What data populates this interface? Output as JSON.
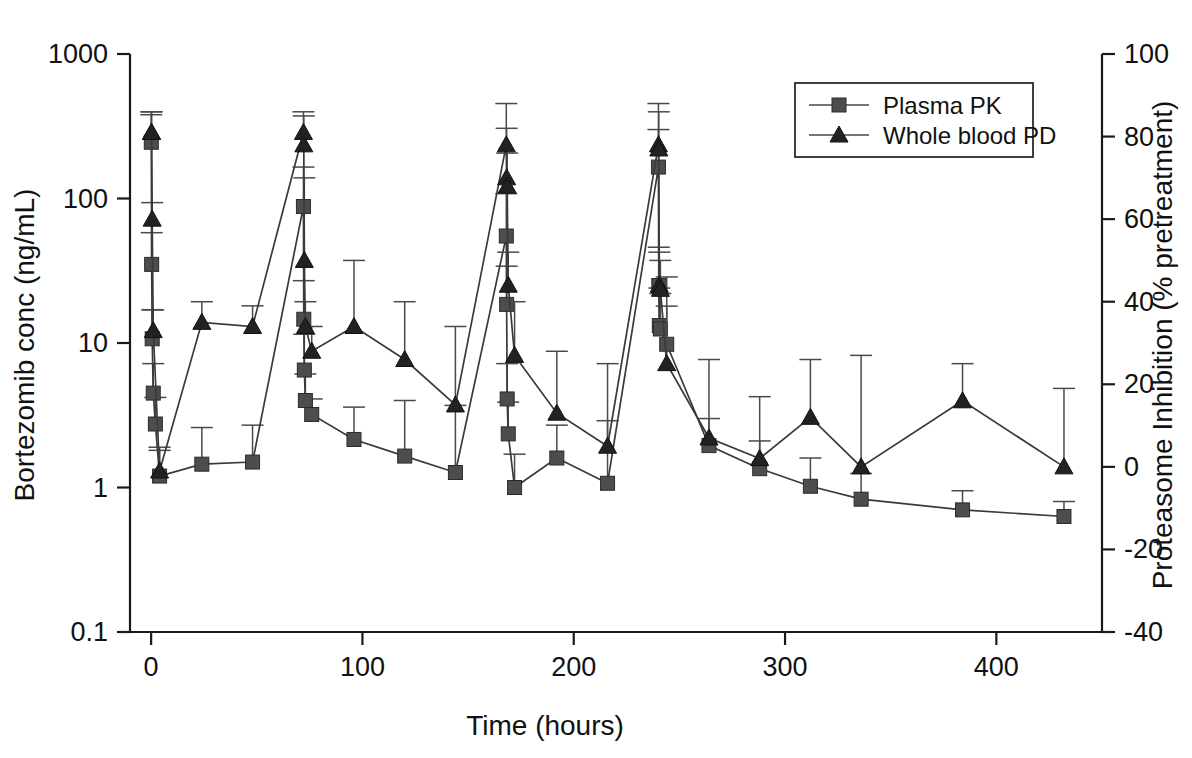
{
  "chart_data": {
    "type": "line",
    "title": "",
    "xlabel": "Time (hours)",
    "ylabel": "Bortezomib conc (ng/mL)",
    "y2label": "Proteasome Inhibition (% pretreatment)",
    "xlim": [
      -10,
      450
    ],
    "xticks": [
      0,
      100,
      200,
      300,
      400
    ],
    "xticklabels": [
      "0",
      "100",
      "200",
      "300",
      "400"
    ],
    "yscale": "log",
    "ylim": [
      0.1,
      1000
    ],
    "yticks": [
      0.1,
      1,
      10,
      100,
      1000
    ],
    "yticklabels": [
      "0.1",
      "1",
      "10",
      "100",
      "1000"
    ],
    "y2lim": [
      -40,
      100
    ],
    "y2ticks": [
      -40,
      -20,
      0,
      20,
      40,
      60,
      80,
      100
    ],
    "y2ticklabels": [
      "-40",
      "-20",
      "0",
      "20",
      "40",
      "60",
      "80",
      "100"
    ],
    "grid": false,
    "legend_position": "top-right",
    "series": [
      {
        "name": "Plasma PK",
        "marker": "square",
        "axis": "left",
        "units": "ng/mL",
        "x": [
          0.08,
          0.25,
          0.5,
          1,
          2,
          4,
          24,
          48,
          72.08,
          72.25,
          72.5,
          73,
          76,
          96,
          120,
          144,
          168.08,
          168.25,
          168.5,
          169,
          172,
          192,
          216,
          240.08,
          240.25,
          240.5,
          241,
          244,
          264,
          288,
          312,
          336,
          384,
          432
        ],
        "values": [
          245,
          35,
          10.7,
          4.5,
          2.75,
          1.2,
          1.45,
          1.5,
          88,
          14.6,
          6.5,
          4.0,
          3.2,
          2.15,
          1.65,
          1.27,
          55,
          18.5,
          4.1,
          2.35,
          1.0,
          1.6,
          1.07,
          165,
          25,
          13.2,
          12.5,
          9.8,
          1.95,
          1.35,
          1.02,
          0.83,
          0.7,
          0.63
        ],
        "err_upper": [
          380,
          58,
          17,
          7.2,
          4.2,
          1.9,
          2.6,
          2.7,
          165,
          27,
          11.5,
          6.1,
          4.1,
          3.6,
          4.0,
          3.7,
          108,
          34,
          7.2,
          3.9,
          1.7,
          2.7,
          2.9,
          300,
          46,
          24,
          22,
          18,
          3.0,
          2.1,
          1.6,
          1.25,
          0.95,
          0.8
        ]
      },
      {
        "name": "Whole blood PD",
        "marker": "triangle",
        "axis": "right",
        "units": "% pretreatment",
        "x": [
          0.08,
          0.25,
          0.5,
          1,
          4,
          24,
          48,
          72.08,
          72.25,
          72.5,
          73,
          76,
          96,
          120,
          144,
          168.08,
          168.25,
          168.5,
          169,
          172,
          192,
          216,
          240.08,
          240.25,
          240.5,
          241,
          244,
          264,
          288,
          312,
          336,
          384,
          432
        ],
        "values_pct": [
          81,
          81,
          60,
          33,
          -1,
          35,
          34,
          81,
          78,
          50,
          34,
          28,
          34,
          26,
          15,
          78,
          70,
          68,
          44,
          27,
          13,
          5,
          78,
          77,
          44,
          43,
          25,
          7,
          2,
          12,
          0,
          16,
          0
        ],
        "values_right_axis": [
          81,
          81,
          60,
          33,
          -1,
          35,
          34,
          81,
          78,
          50,
          34,
          28,
          34,
          26,
          15,
          78,
          70,
          68,
          44,
          27,
          13,
          5,
          78,
          77,
          44,
          43,
          25,
          7,
          2,
          12,
          0,
          16,
          0
        ],
        "err_upper_pct": [
          86,
          86,
          64,
          38,
          4,
          40,
          39,
          86,
          85,
          70,
          40,
          34,
          50,
          40,
          34,
          88,
          82,
          76,
          52,
          40,
          28,
          25,
          88,
          86,
          52,
          50,
          46,
          26,
          17,
          26,
          27,
          25,
          19
        ]
      }
    ]
  },
  "axes": {
    "left_title": "Bortezomib conc (ng/mL)",
    "right_title": "Proteasome Inhibition (% pretreatment)",
    "bottom_title": "Time (hours)"
  },
  "legend": {
    "items": [
      {
        "label": "Plasma PK",
        "marker": "square"
      },
      {
        "label": "Whole blood PD",
        "marker": "triangle"
      }
    ]
  },
  "colors": {
    "axis": "#1a1a1a",
    "series_pk": "#4d4d4d",
    "series_pd": "#222222",
    "background": "#ffffff"
  }
}
